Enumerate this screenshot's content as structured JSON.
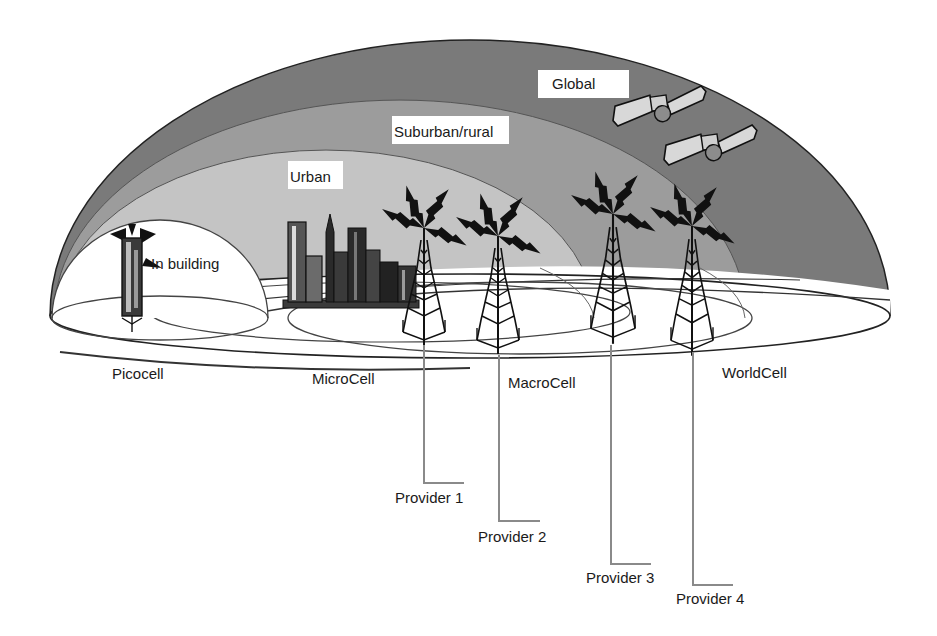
{
  "colors": {
    "global": "#7a7a7a",
    "suburban": "#9c9c9c",
    "urban": "#c4c4c4",
    "in_building": "#ffffff",
    "outline": "#222222",
    "provider_line": "#8a8a8a",
    "satellite_panel": "#d8d8d8",
    "satellite_body": "#8c8c8c",
    "city_dark": "#2a2a2a",
    "city_mid": "#6b6b6b",
    "lightning": "#111111"
  },
  "zones": [
    {
      "id": "global",
      "label": "Global"
    },
    {
      "id": "suburban",
      "label": "Suburban/rural"
    },
    {
      "id": "urban",
      "label": "Urban"
    },
    {
      "id": "in_building",
      "label": "In building"
    }
  ],
  "cells": [
    {
      "id": "picocell",
      "label": "Picocell"
    },
    {
      "id": "microcell",
      "label": "MicroCell"
    },
    {
      "id": "macrocell",
      "label": "MacroCell"
    },
    {
      "id": "worldcell",
      "label": "WorldCell"
    }
  ],
  "providers": [
    {
      "id": "provider1",
      "label": "Provider 1"
    },
    {
      "id": "provider2",
      "label": "Provider 2"
    },
    {
      "id": "provider3",
      "label": "Provider 3"
    },
    {
      "id": "provider4",
      "label": "Provider 4"
    }
  ],
  "icons": {
    "satellite": "satellite-icon",
    "tower": "radio-tower-icon",
    "city": "city-skyline-icon",
    "building_antenna": "building-antenna-icon"
  }
}
